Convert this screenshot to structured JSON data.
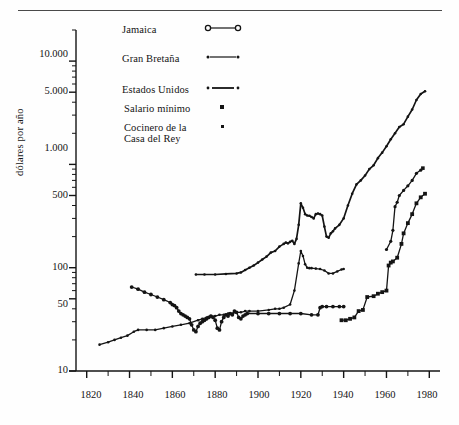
{
  "chart_data": {
    "type": "line",
    "title": "",
    "xlabel": "",
    "ylabel": "dólares por año",
    "yscale": "log",
    "ylim": [
      10,
      20000
    ],
    "xlim": [
      1815,
      1985
    ],
    "grid": false,
    "legend_position": "top-left-inside",
    "ytick_labels": [
      "10",
      "50",
      "100",
      "500",
      "1.000",
      "5.000",
      "10.000"
    ],
    "ytick_values": [
      10,
      50,
      100,
      500,
      1000,
      5000,
      10000
    ],
    "xtick_labels": [
      "1820",
      "1840",
      "1860",
      "1880",
      "1900",
      "1920",
      "1940",
      "1960",
      "1980"
    ],
    "xtick_values": [
      1820,
      1840,
      1860,
      1880,
      1900,
      1920,
      1940,
      1960,
      1980
    ],
    "xminor_step": 10,
    "series": [
      {
        "name": "Jamaica",
        "marker": "open-circle",
        "style": "line-with-markers",
        "points": [
          [
            1841,
            65
          ],
          [
            1844,
            62
          ],
          [
            1847,
            58
          ],
          [
            1850,
            55
          ],
          [
            1853,
            52
          ],
          [
            1856,
            49
          ],
          [
            1859,
            46
          ],
          [
            1860,
            44
          ],
          [
            1861,
            43
          ],
          [
            1862,
            41
          ],
          [
            1863,
            38
          ],
          [
            1864,
            36
          ],
          [
            1865,
            35
          ],
          [
            1866,
            34
          ],
          [
            1867,
            33
          ],
          [
            1868,
            32
          ],
          [
            1869,
            28
          ],
          [
            1870,
            25
          ],
          [
            1871,
            24
          ],
          [
            1872,
            27
          ],
          [
            1873,
            29
          ],
          [
            1874,
            30
          ],
          [
            1875,
            31
          ],
          [
            1876,
            32
          ],
          [
            1877,
            33
          ],
          [
            1878,
            34
          ],
          [
            1879,
            33
          ],
          [
            1880,
            31
          ],
          [
            1881,
            26
          ],
          [
            1882,
            25
          ],
          [
            1883,
            30
          ],
          [
            1884,
            33
          ],
          [
            1885,
            35
          ],
          [
            1886,
            34
          ],
          [
            1887,
            36
          ],
          [
            1888,
            35
          ],
          [
            1889,
            38
          ],
          [
            1890,
            37
          ],
          [
            1891,
            33
          ],
          [
            1892,
            32
          ],
          [
            1893,
            34
          ],
          [
            1894,
            35
          ],
          [
            1895,
            36
          ],
          [
            1900,
            36
          ],
          [
            1905,
            36
          ],
          [
            1910,
            36
          ],
          [
            1915,
            36
          ],
          [
            1920,
            36
          ],
          [
            1925,
            35
          ],
          [
            1928,
            35
          ],
          [
            1929,
            41
          ],
          [
            1930,
            42
          ],
          [
            1932,
            42
          ],
          [
            1935,
            42
          ],
          [
            1938,
            42
          ],
          [
            1940,
            42
          ]
        ]
      },
      {
        "name": "Gran Bretaña",
        "marker": "dot",
        "style": "line-with-dots",
        "points": [
          [
            1826,
            18
          ],
          [
            1830,
            19
          ],
          [
            1833,
            20
          ],
          [
            1836,
            21
          ],
          [
            1839,
            22
          ],
          [
            1842,
            24
          ],
          [
            1844,
            25
          ],
          [
            1848,
            25
          ],
          [
            1852,
            25
          ],
          [
            1856,
            26
          ],
          [
            1860,
            27
          ],
          [
            1864,
            28
          ],
          [
            1868,
            29
          ],
          [
            1872,
            31
          ],
          [
            1874,
            32
          ],
          [
            1876,
            33
          ],
          [
            1878,
            34
          ],
          [
            1880,
            34
          ],
          [
            1882,
            35
          ],
          [
            1884,
            35
          ],
          [
            1886,
            36
          ],
          [
            1888,
            36
          ],
          [
            1890,
            37
          ],
          [
            1892,
            37
          ],
          [
            1894,
            38
          ],
          [
            1896,
            38
          ],
          [
            1900,
            38
          ],
          [
            1905,
            39
          ],
          [
            1908,
            40
          ],
          [
            1910,
            40
          ],
          [
            1912,
            41
          ],
          [
            1915,
            44
          ],
          [
            1917,
            60
          ],
          [
            1919,
            110
          ],
          [
            1920,
            145
          ],
          [
            1921,
            130
          ],
          [
            1922,
            108
          ],
          [
            1923,
            100
          ],
          [
            1924,
            99
          ],
          [
            1925,
            99
          ],
          [
            1927,
            98
          ],
          [
            1929,
            97
          ],
          [
            1931,
            94
          ],
          [
            1933,
            88
          ],
          [
            1935,
            88
          ],
          [
            1937,
            92
          ],
          [
            1939,
            96
          ],
          [
            1940,
            97
          ]
        ]
      },
      {
        "name": "Estados Unidos",
        "marker": "dot",
        "style": "line",
        "points": [
          [
            1871,
            86
          ],
          [
            1875,
            86
          ],
          [
            1880,
            86
          ],
          [
            1885,
            87
          ],
          [
            1890,
            88
          ],
          [
            1892,
            90
          ],
          [
            1894,
            95
          ],
          [
            1896,
            100
          ],
          [
            1898,
            105
          ],
          [
            1900,
            112
          ],
          [
            1902,
            120
          ],
          [
            1904,
            128
          ],
          [
            1906,
            140
          ],
          [
            1908,
            145
          ],
          [
            1910,
            160
          ],
          [
            1912,
            170
          ],
          [
            1913,
            175
          ],
          [
            1914,
            172
          ],
          [
            1915,
            178
          ],
          [
            1916,
            182
          ],
          [
            1917,
            170
          ],
          [
            1918,
            190
          ],
          [
            1919,
            260
          ],
          [
            1920,
            420
          ],
          [
            1921,
            380
          ],
          [
            1922,
            330
          ],
          [
            1923,
            320
          ],
          [
            1924,
            318
          ],
          [
            1925,
            310
          ],
          [
            1926,
            300
          ],
          [
            1927,
            330
          ],
          [
            1928,
            335
          ],
          [
            1929,
            330
          ],
          [
            1930,
            320
          ],
          [
            1931,
            250
          ],
          [
            1932,
            200
          ],
          [
            1933,
            195
          ],
          [
            1934,
            215
          ],
          [
            1935,
            225
          ],
          [
            1936,
            240
          ],
          [
            1938,
            260
          ],
          [
            1940,
            300
          ],
          [
            1942,
            400
          ],
          [
            1944,
            520
          ],
          [
            1946,
            640
          ],
          [
            1948,
            700
          ],
          [
            1950,
            780
          ],
          [
            1952,
            900
          ],
          [
            1954,
            980
          ],
          [
            1956,
            1150
          ],
          [
            1958,
            1300
          ],
          [
            1960,
            1500
          ],
          [
            1962,
            1750
          ],
          [
            1964,
            2000
          ],
          [
            1966,
            2300
          ],
          [
            1968,
            2450
          ],
          [
            1970,
            2900
          ],
          [
            1972,
            3400
          ],
          [
            1974,
            4200
          ],
          [
            1976,
            4800
          ],
          [
            1978,
            5100
          ]
        ]
      },
      {
        "name": "Salario mínimo",
        "marker": "square",
        "style": "line-with-markers",
        "points": [
          [
            1939,
            31
          ],
          [
            1941,
            31
          ],
          [
            1943,
            32
          ],
          [
            1945,
            33
          ],
          [
            1947,
            38
          ],
          [
            1949,
            39
          ],
          [
            1951,
            52
          ],
          [
            1954,
            53
          ],
          [
            1956,
            56
          ],
          [
            1958,
            58
          ],
          [
            1960,
            60
          ],
          [
            1961,
            105
          ],
          [
            1962,
            112
          ],
          [
            1963,
            115
          ],
          [
            1965,
            125
          ],
          [
            1967,
            170
          ],
          [
            1968,
            215
          ],
          [
            1970,
            270
          ],
          [
            1972,
            330
          ],
          [
            1974,
            420
          ],
          [
            1976,
            480
          ],
          [
            1978,
            520
          ]
        ]
      },
      {
        "name": "Cocinero de la Casa del Rey",
        "marker": "small-dot",
        "style": "line-with-markers",
        "points": [
          [
            1960,
            150
          ],
          [
            1962,
            180
          ],
          [
            1963,
            230
          ],
          [
            1964,
            390
          ],
          [
            1965,
            430
          ],
          [
            1966,
            500
          ],
          [
            1968,
            560
          ],
          [
            1970,
            620
          ],
          [
            1972,
            700
          ],
          [
            1974,
            820
          ],
          [
            1976,
            880
          ]
        ],
        "isolated_points": [
          [
            1977,
            920
          ]
        ]
      }
    ]
  },
  "legend": {
    "items": [
      {
        "label": "Jamaica",
        "marker": "open-circle",
        "has_line": true
      },
      {
        "label": "Gran Bretaña",
        "marker": "dot",
        "has_line": true
      },
      {
        "label": "Estados Unidos",
        "marker": "dot",
        "has_line": true
      },
      {
        "label": "Salario mínimo",
        "marker": "square",
        "has_line": false
      },
      {
        "label_line1": "Cocinero de la",
        "label_line2": "Casa del Rey",
        "marker": "small-dot",
        "has_line": false
      }
    ]
  },
  "colors": {
    "ink": "#141414",
    "rule": "#4a4a4a",
    "background": "#fefefe"
  }
}
